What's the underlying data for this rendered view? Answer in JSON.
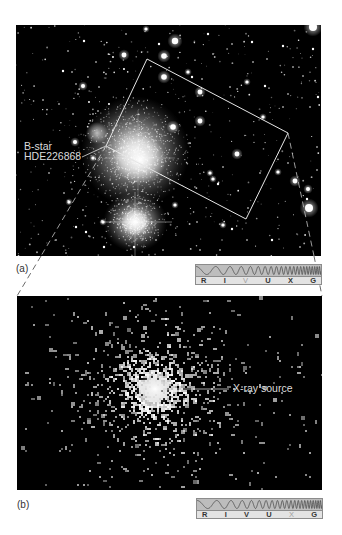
{
  "panel_a": {
    "label": "(a)",
    "image": "optical star field",
    "annotations": {
      "bstar_line1": "B-star",
      "bstar_line2": "HDE226868"
    },
    "spectrum": {
      "bands": [
        "R",
        "I",
        "V",
        "U",
        "X",
        "G"
      ],
      "highlighted": "V"
    }
  },
  "panel_b": {
    "label": "(b)",
    "image": "x-ray image",
    "annotations": {
      "xray": "X-ray source"
    },
    "spectrum": {
      "bands": [
        "R",
        "I",
        "V",
        "U",
        "X",
        "G"
      ],
      "highlighted": "X"
    }
  },
  "colors": {
    "image_background": "#000000",
    "annotation_text": "#dcdcdc",
    "panel_label_text": "#333333",
    "spectrum_wave_bg": "#bdbdbd",
    "spectrum_band_bg": "#e3e3e3",
    "spectrum_highlight": "#a0a0a0"
  }
}
